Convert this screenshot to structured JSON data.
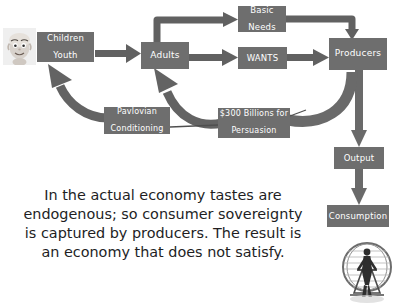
{
  "diagram": {
    "accent_box_color": "#6e6e6e",
    "arrow_color": "#5f5f5f",
    "text_color": "#ffffff",
    "caption_color": "#221e1f",
    "nodes": [
      {
        "id": "children",
        "label": "Children\nYouth",
        "line1": "Children",
        "line2": "Youth"
      },
      {
        "id": "adults",
        "label": "Adults",
        "line1": "Adults",
        "line2": ""
      },
      {
        "id": "basic",
        "label": "Basic\nNeeds",
        "line1": "Basic",
        "line2": "Needs"
      },
      {
        "id": "wants",
        "label": "WANTS",
        "line1": "WANTS",
        "line2": ""
      },
      {
        "id": "producers",
        "label": "Producers",
        "line1": "Producers",
        "line2": ""
      },
      {
        "id": "pavlovian",
        "label": "Pavlovian\nConditioning",
        "line1": "Pavlovian",
        "line2": "Conditioning"
      },
      {
        "id": "money",
        "label": "$300 Billions for\nPersuasion",
        "line1": "$300 Billions for",
        "line2": "Persuasion"
      },
      {
        "id": "output",
        "label": "Output",
        "line1": "Output",
        "line2": ""
      },
      {
        "id": "consumption",
        "label": "Consumption",
        "line1": "Consumption",
        "line2": ""
      }
    ],
    "edges": [
      {
        "from": "children",
        "to": "adults",
        "style": "straight-arrow"
      },
      {
        "from": "adults",
        "to": "basic",
        "style": "elbow-up-arrow"
      },
      {
        "from": "adults",
        "to": "wants",
        "style": "straight-arrow"
      },
      {
        "from": "basic",
        "to": "producers",
        "style": "elbow-down-arrow"
      },
      {
        "from": "wants",
        "to": "producers",
        "style": "straight-arrow"
      },
      {
        "from": "producers",
        "to": "money",
        "style": "thick-curve"
      },
      {
        "from": "producers",
        "to": "output",
        "style": "straight-down-arrow"
      },
      {
        "from": "output",
        "to": "consumption",
        "style": "straight-down-arrow"
      },
      {
        "from": "pavlovian",
        "to": "children",
        "style": "curved-up-arrow"
      },
      {
        "from": "money",
        "to": "adults",
        "style": "curved-up-arrow"
      },
      {
        "from": "money",
        "to": "pavlovian",
        "style": "thin-connector"
      }
    ],
    "images": [
      {
        "id": "baby-photo",
        "name": "child-face-photo",
        "alt": "Photograph of a baby's face"
      },
      {
        "id": "wheel-photo",
        "name": "hamster-wheel-photo",
        "alt": "Person running inside a hamster wheel"
      }
    ]
  },
  "caption": {
    "lines": [
      "In the actual economy tastes are",
      "endogenous; so consumer sovereignty",
      "is captured by producers. The result is",
      "an economy that does not satisfy."
    ],
    "full": "In the actual economy tastes are endogenous; so consumer sovereignty is captured by producers. The result is an economy that does not satisfy."
  }
}
